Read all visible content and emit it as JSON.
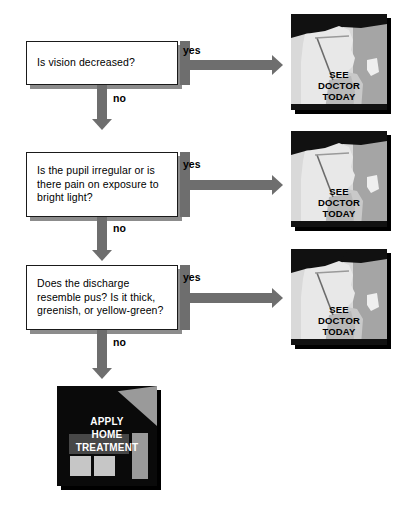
{
  "diagram": {
    "labels": {
      "yes": "yes",
      "no": "no"
    },
    "steps": [
      {
        "id": "step-1",
        "question": "Is vision decreased?",
        "yes_outcome": "see-doctor-today",
        "no_outcome": "step-2"
      },
      {
        "id": "step-2",
        "question": "Is the pupil irregular or is there pain on exposure to bright light?",
        "yes_outcome": "see-doctor-today",
        "no_outcome": "step-3"
      },
      {
        "id": "step-3",
        "question": "Does the discharge resemble pus?  Is it thick, greenish, or yellow-green?",
        "yes_outcome": "see-doctor-today",
        "no_outcome": "apply-home-treatment"
      }
    ],
    "outcomes": {
      "see_doctor": {
        "line1": "SEE",
        "line2": "DOCTOR",
        "line3": "TODAY",
        "full": "SEE DOCTOR TODAY",
        "icon": "doctor-profile-icon"
      },
      "home_treatment": {
        "line1": "APPLY",
        "line2": "HOME",
        "line3": "TREATMENT",
        "full": "APPLY HOME TREATMENT",
        "icon": "house-icon"
      }
    },
    "colors": {
      "arrow": "#6e6e6e",
      "box_border": "#1a1a1a",
      "box_shadow": "#8c8c8c",
      "panel_shadow": "#000000",
      "panel_background": "#d9d9d9",
      "panel_dark": "#000000",
      "panel_mid_gray": "#a5a5a5",
      "panel_light": "#e8e8e8",
      "home_panel_bg": "#000000",
      "text": "#000000",
      "page_background": "#ffffff"
    }
  }
}
